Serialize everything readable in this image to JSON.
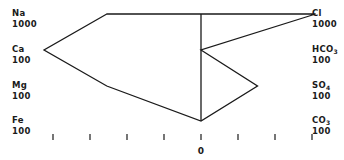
{
  "left_ions": [
    {
      "name": "Na",
      "scale": "1000",
      "value_fraction": 0.6
    },
    {
      "name": "Ca",
      "scale": "100",
      "value_fraction": 1.0
    },
    {
      "name": "Mg",
      "scale": "100",
      "value_fraction": 0.6
    },
    {
      "name": "Fe",
      "scale": "100",
      "value_fraction": 0.0
    }
  ],
  "right_ions": [
    {
      "name": "Cl",
      "sub": "",
      "scale": "1000",
      "value_fraction": 0.73
    },
    {
      "name": "HCO",
      "sub": "3",
      "scale": "100",
      "value_fraction": 0.0
    },
    {
      "name": "SO",
      "sub": "4",
      "scale": "100",
      "value_fraction": 0.36
    },
    {
      "name": "CO",
      "sub": "3",
      "scale": "100",
      "value_fraction": 0.0
    }
  ],
  "axis": {
    "zero_label": "0",
    "tick_count_each_side": 4
  },
  "colors": {
    "line": "#1a1a1a",
    "background": "#ffffff"
  }
}
